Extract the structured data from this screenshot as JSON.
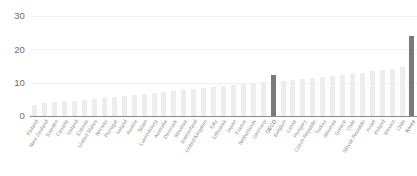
{
  "chart_data": {
    "type": "bar",
    "title": "",
    "subtitle": "",
    "xlabel": "",
    "ylabel": "",
    "ylim": [
      0,
      30
    ],
    "ytick_values": [
      0,
      10,
      20,
      30
    ],
    "ytick_labels": [
      "0",
      "10",
      "20",
      "30"
    ],
    "grid": true,
    "grid_axis": "y",
    "legend": "none",
    "orientation": "vertical",
    "sorted": "ascending",
    "highlight_color": "#7a7a7a",
    "bar_color": "#ededed",
    "axis_color": "#8a8a8a",
    "label_color": "#8f8f8f",
    "tick_label_color": "#6d6d6d",
    "highlighted_categories": [
      "OECD",
      "Korea"
    ],
    "categories": [
      "Finland",
      "New Zealand",
      "Sweden",
      "Canada",
      "Iceland",
      "Estonia",
      "United States",
      "Norway",
      "Portugal",
      "Ireland",
      "Austria",
      "Spain",
      "Luxembourg",
      "Australia",
      "Denmark",
      "Slovenia",
      "Switzerland",
      "United Kingdom",
      "Italy",
      "Lithuania",
      "Japan",
      "France",
      "Netherlands",
      "Germany",
      "OECD",
      "Belgium",
      "Latvia",
      "Hungary",
      "Czech Republic",
      "Turkey",
      "Slovenia",
      "Greece",
      "Chile",
      "Slovak Republic",
      "Israel",
      "Poland",
      "Mexico",
      "Chile",
      "Korea"
    ],
    "values": [
      3.4,
      3.8,
      4.1,
      4.4,
      4.6,
      4.8,
      5.2,
      5.5,
      5.8,
      6.1,
      6.4,
      6.7,
      7.0,
      7.3,
      7.6,
      7.9,
      8.2,
      8.5,
      8.8,
      9.1,
      9.4,
      9.7,
      10.0,
      10.3,
      12.2,
      10.6,
      10.9,
      11.2,
      11.4,
      11.7,
      12.0,
      12.3,
      12.6,
      13.0,
      13.4,
      13.8,
      14.2,
      14.6,
      24.0
    ]
  }
}
